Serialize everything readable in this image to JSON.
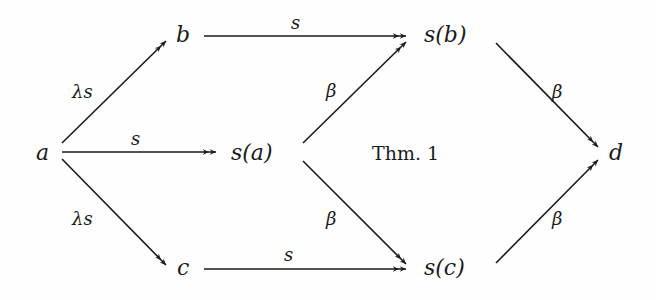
{
  "diagram": {
    "nodes": [
      {
        "id": "a",
        "label": "a",
        "x": 43,
        "y": 160
      },
      {
        "id": "b",
        "label": "b",
        "x": 182,
        "y": 63
      },
      {
        "id": "sa",
        "label": "s(a)",
        "x": 258,
        "y": 160
      },
      {
        "id": "sb",
        "label": "s(b)",
        "x": 428,
        "y": 63
      },
      {
        "id": "sc",
        "label": "s(c)",
        "x": 428,
        "y": 275
      },
      {
        "id": "c",
        "label": "c",
        "x": 182,
        "y": 275
      },
      {
        "id": "d",
        "label": "d",
        "x": 622,
        "y": 160
      }
    ],
    "annotation": {
      "label": "Thm. 1",
      "x": 405,
      "y": 160
    },
    "edges": [
      {
        "from": "a",
        "to": "b",
        "label": "λs"
      },
      {
        "from": "a",
        "to": "sa",
        "label": "s"
      },
      {
        "from": "a",
        "to": "c",
        "label": "λs"
      },
      {
        "from": "b",
        "to": "sb",
        "label": "s"
      },
      {
        "from": "sa",
        "to": "sb",
        "label": "β"
      },
      {
        "from": "sa",
        "to": "sc",
        "label": "β"
      },
      {
        "from": "c",
        "to": "sc",
        "label": "s"
      },
      {
        "from": "sb",
        "to": "d",
        "label": "β"
      },
      {
        "from": "sc",
        "to": "d",
        "label": "β"
      }
    ]
  },
  "labels": {
    "node_a": "a",
    "node_b": "b",
    "node_sa": "s(a)",
    "node_sb": "s(b)",
    "node_sc": "s(c)",
    "node_c": "c",
    "node_d": "d",
    "thm": "Thm. 1",
    "e_a_b": "λs",
    "e_a_sa": "s",
    "e_a_c": "λs",
    "e_b_sb": "s",
    "e_sa_sb": "β",
    "e_sa_sc": "β",
    "e_c_sc": "s",
    "e_sb_d": "β",
    "e_sc_d": "β"
  }
}
